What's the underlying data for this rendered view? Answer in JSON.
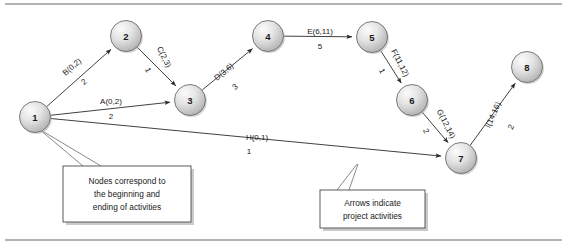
{
  "figure": {
    "background_color": "#ffffff",
    "rule_color": "#9a9a9a",
    "node_fill_light": "#f2f2f2",
    "node_fill_dark": "#b5b5b5",
    "node_stroke": "#6e6e6e",
    "edge_color": "#2b2b2b",
    "text_color": "#1a1a1a"
  },
  "nodes": [
    {
      "id": "1",
      "label": "1",
      "x": 35,
      "y": 117,
      "r": 15.5
    },
    {
      "id": "2",
      "label": "2",
      "x": 126,
      "y": 36,
      "r": 15.5
    },
    {
      "id": "3",
      "label": "3",
      "x": 190,
      "y": 100,
      "r": 15.5
    },
    {
      "id": "4",
      "label": "4",
      "x": 268,
      "y": 36,
      "r": 15.5
    },
    {
      "id": "5",
      "label": "5",
      "x": 372,
      "y": 37,
      "r": 15.5
    },
    {
      "id": "6",
      "label": "6",
      "x": 412,
      "y": 100,
      "r": 15.5
    },
    {
      "id": "7",
      "label": "7",
      "x": 461,
      "y": 158,
      "r": 15.5
    },
    {
      "id": "8",
      "label": "8",
      "x": 527,
      "y": 67,
      "r": 15.5
    }
  ],
  "edges": [
    {
      "id": "B",
      "from": "1",
      "to": "2",
      "label": "B(0,2)",
      "duration": "2",
      "early_start": 0,
      "early_finish": 2,
      "label_x": 72,
      "label_y": 67,
      "label_rotate": -41,
      "dur_x": 84,
      "dur_y": 82,
      "dur_rotate": -41
    },
    {
      "id": "C",
      "from": "2",
      "to": "3",
      "label": "C(2,3)",
      "duration": "1",
      "early_start": 2,
      "early_finish": 3,
      "label_x": 164,
      "label_y": 57,
      "label_rotate": 63,
      "dur_x": 148,
      "dur_y": 70,
      "dur_rotate": 63
    },
    {
      "id": "A",
      "from": "1",
      "to": "3",
      "label": "A(0,2)",
      "duration": "2",
      "early_start": 0,
      "early_finish": 2,
      "label_x": 111,
      "label_y": 101,
      "label_rotate": 0,
      "dur_x": 111,
      "dur_y": 116,
      "dur_rotate": 0
    },
    {
      "id": "D",
      "from": "3",
      "to": "4",
      "label": "D(3,6)",
      "duration": "3",
      "early_start": 3,
      "early_finish": 6,
      "label_x": 224,
      "label_y": 72,
      "label_rotate": -40,
      "dur_x": 235,
      "dur_y": 87,
      "dur_rotate": -40
    },
    {
      "id": "E",
      "from": "4",
      "to": "5",
      "label": "E(6,11)",
      "duration": "5",
      "early_start": 6,
      "early_finish": 11,
      "label_x": 320,
      "label_y": 31,
      "label_rotate": 0,
      "dur_x": 320,
      "dur_y": 46,
      "dur_rotate": 0
    },
    {
      "id": "F",
      "from": "5",
      "to": "6",
      "label": "F(11,12)",
      "duration": "1",
      "early_start": 11,
      "early_finish": 12,
      "label_x": 400,
      "label_y": 63,
      "label_rotate": 63,
      "dur_x": 382,
      "dur_y": 71,
      "dur_rotate": 63
    },
    {
      "id": "G",
      "from": "6",
      "to": "7",
      "label": "G(12,14)",
      "duration": "2",
      "early_start": 12,
      "early_finish": 14,
      "label_x": 446,
      "label_y": 124,
      "label_rotate": 63,
      "dur_x": 426,
      "dur_y": 131,
      "dur_rotate": 63
    },
    {
      "id": "H",
      "from": "1",
      "to": "7",
      "label": "H(0,1)",
      "duration": "1",
      "early_start": 0,
      "early_finish": 1,
      "label_x": 257,
      "label_y": 137,
      "label_rotate": 0,
      "dur_x": 249,
      "dur_y": 151,
      "dur_rotate": 0
    },
    {
      "id": "I",
      "from": "7",
      "to": "8",
      "label": "I(14,16)",
      "duration": "2",
      "early_start": 14,
      "early_finish": 16,
      "label_x": 493,
      "label_y": 115,
      "label_rotate": -66,
      "dur_x": 511,
      "dur_y": 127,
      "dur_rotate": -66
    }
  ],
  "callouts": [
    {
      "id": "nodes-callout",
      "lines": [
        "Nodes correspond to",
        "the beginning and",
        "ending of activities"
      ],
      "box": {
        "x": 63,
        "y": 166,
        "w": 128,
        "h": 56
      },
      "leaders": [
        {
          "x1": 39,
          "y1": 129,
          "x2": 83,
          "y2": 166
        },
        {
          "x1": 39,
          "y1": 129,
          "x2": 101,
          "y2": 166
        }
      ]
    },
    {
      "id": "arrows-callout",
      "lines": [
        "Arrows indicate",
        "project activities"
      ],
      "box": {
        "x": 320,
        "y": 190,
        "w": 105,
        "h": 38
      },
      "leaders": [
        {
          "x1": 337,
          "y1": 190,
          "x2": 357,
          "y2": 164
        },
        {
          "x1": 349,
          "y1": 190,
          "x2": 358,
          "y2": 164
        }
      ]
    }
  ],
  "rules": [
    {
      "id": "top-rule",
      "x1": 5,
      "y1": 4,
      "x2": 562,
      "y2": 4
    },
    {
      "id": "bottom-rule",
      "x1": 5,
      "y1": 240,
      "x2": 562,
      "y2": 240
    }
  ]
}
